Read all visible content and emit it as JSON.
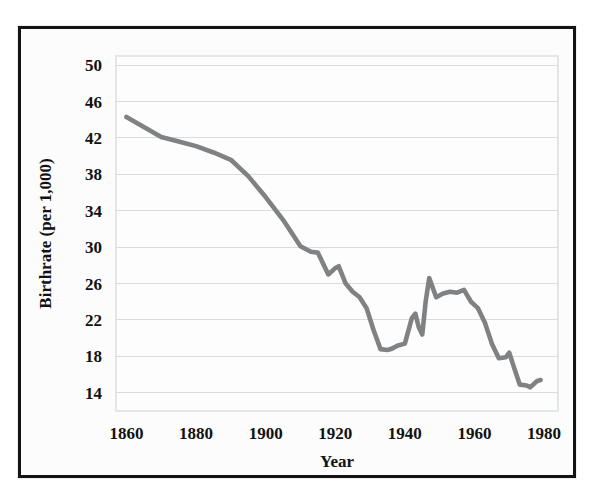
{
  "figure": {
    "background_color": "#ffffff",
    "frame_color": "#131313",
    "plot_background": "#fdfdfd",
    "grid_color": "#d9dde0"
  },
  "chart_data": {
    "type": "line",
    "title": "",
    "subtitle": "",
    "xlabel": "Year",
    "ylabel": "Birthrate (per 1,000)",
    "xlim": [
      1857,
      1984
    ],
    "ylim": [
      12,
      51
    ],
    "xticks": [
      1860,
      1880,
      1900,
      1920,
      1940,
      1960,
      1980
    ],
    "xtick_labels": [
      "1860",
      "1880",
      "1900",
      "1920",
      "1940",
      "1960",
      "1980"
    ],
    "yticks": [
      14,
      18,
      22,
      26,
      30,
      34,
      38,
      42,
      46,
      50
    ],
    "ytick_labels": [
      "14",
      "18",
      "22",
      "26",
      "30",
      "34",
      "38",
      "42",
      "46",
      "50"
    ],
    "grid": true,
    "grid_axis": "y",
    "legend": false,
    "legend_position": "none",
    "line_color": "#7f8183",
    "line_width": 4.6,
    "series": [
      {
        "name": "Birthrate",
        "x": [
          1860,
          1865,
          1870,
          1875,
          1880,
          1885,
          1890,
          1895,
          1900,
          1905,
          1910,
          1913,
          1915,
          1918,
          1920,
          1921,
          1923,
          1925,
          1927,
          1929,
          1931,
          1933,
          1935,
          1936,
          1938,
          1940,
          1942,
          1943,
          1944,
          1945,
          1946,
          1947,
          1949,
          1951,
          1953,
          1955,
          1957,
          1959,
          1961,
          1963,
          1965,
          1967,
          1969,
          1970,
          1971,
          1973,
          1975,
          1976,
          1978,
          1979
        ],
        "values": [
          44.3,
          43.2,
          42.1,
          41.6,
          41.1,
          40.4,
          39.6,
          37.8,
          35.5,
          33.0,
          30.1,
          29.5,
          29.4,
          27.0,
          27.7,
          27.9,
          26.0,
          25.1,
          24.5,
          23.3,
          20.9,
          18.8,
          18.7,
          18.8,
          19.2,
          19.4,
          22.2,
          22.7,
          21.2,
          20.4,
          24.1,
          26.6,
          24.5,
          24.9,
          25.1,
          25.0,
          25.3,
          24.0,
          23.3,
          21.7,
          19.4,
          17.8,
          17.9,
          18.4,
          17.2,
          14.9,
          14.8,
          14.6,
          15.3,
          15.4
        ]
      }
    ],
    "annotations": []
  }
}
